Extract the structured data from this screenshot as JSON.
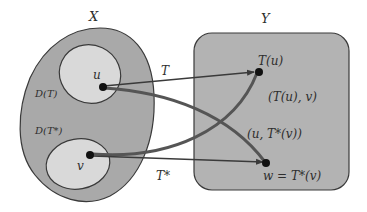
{
  "diagram": {
    "sets": {
      "X": {
        "label": "X"
      },
      "Y": {
        "label": "Y"
      },
      "domain_T": {
        "label": "D(T)"
      },
      "domain_T_star": {
        "label": "D(T*)"
      }
    },
    "points": {
      "u": {
        "label": "u"
      },
      "v": {
        "label": "v"
      },
      "Tu": {
        "label": "T(u)"
      },
      "w": {
        "label": "w = T*(v)"
      }
    },
    "arrows": {
      "T": {
        "label": "T"
      },
      "T_star": {
        "label": "T*"
      }
    },
    "pairs": {
      "Tu_v": {
        "label": "(T(u), v)"
      },
      "u_Tstar_v": {
        "label": "(u, T*(v))"
      }
    },
    "colors": {
      "outer_set_fill": "#a9a9a9",
      "inner_set_fill": "#d9d9d9",
      "box_fill": "#b3b3b3",
      "stroke": "#3a3a3a",
      "curve": "#555555"
    }
  }
}
